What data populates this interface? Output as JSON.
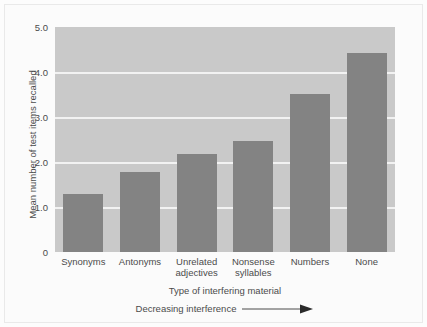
{
  "chart_data": {
    "type": "bar",
    "title": "",
    "categories": [
      "Synonyms",
      "Antonyms",
      "Unrelated adjectives",
      "Nonsense syllables",
      "Numbers",
      "None"
    ],
    "category_lines": [
      [
        "Synonyms"
      ],
      [
        "Antonyms"
      ],
      [
        "Unrelated",
        "adjectives"
      ],
      [
        "Nonsense",
        "syllables"
      ],
      [
        "Numbers"
      ],
      [
        "None"
      ]
    ],
    "values": [
      1.28,
      1.78,
      2.17,
      2.47,
      3.52,
      4.42
    ],
    "xlabel": "Type of interfering material",
    "ylabel": "Mean number of test items recalled",
    "ylim": [
      0,
      5.0
    ],
    "yticks": [
      0,
      1.0,
      2.0,
      3.0,
      4.0,
      5.0
    ],
    "ytick_labels": [
      "0",
      "1.0",
      "2.0",
      "3.0",
      "4.0",
      "5.0"
    ],
    "gridlines": [
      1.0,
      2.0,
      3.0,
      4.0
    ],
    "grid": true,
    "legend": "none",
    "annotation": "Decreasing interference",
    "annotation_arrow": "right-arrow",
    "colors": {
      "bar": "#838383",
      "plot_background": "#c9c9c9",
      "gridline": "#f2f2f2",
      "text": "#4b4b4b",
      "figure_background": "#fbfbfb"
    }
  }
}
